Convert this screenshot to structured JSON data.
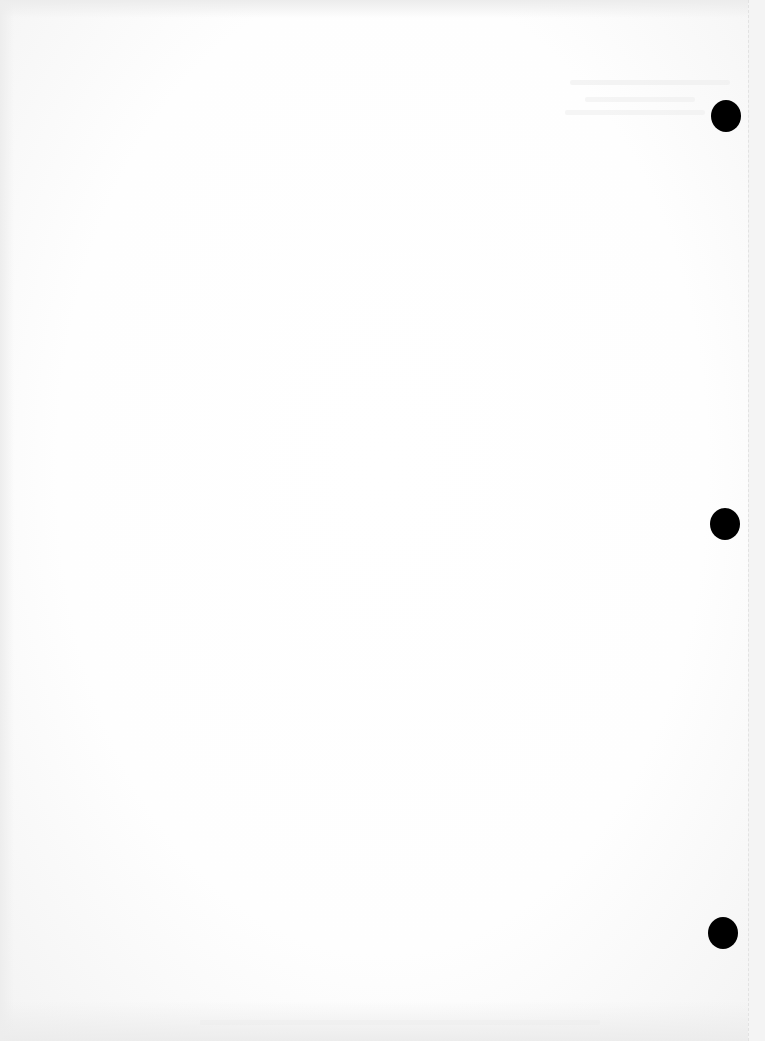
{
  "document": {
    "type": "blank scanned page",
    "text": "",
    "punch_holes": [
      {
        "x": 726,
        "y": 116
      },
      {
        "x": 725,
        "y": 524
      },
      {
        "x": 723,
        "y": 933
      }
    ],
    "colors": {
      "paper": "#ffffff",
      "hole": "#000000",
      "edge_shading": "#ececec"
    }
  }
}
